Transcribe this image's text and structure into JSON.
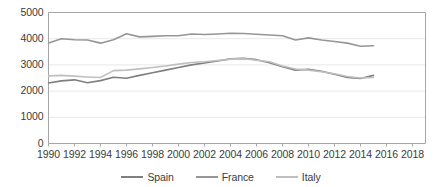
{
  "chart_data": {
    "type": "line",
    "title": "",
    "xlabel": "",
    "ylabel": "",
    "xlim": [
      1990,
      2019
    ],
    "ylim": [
      0,
      5000
    ],
    "ytick_values": [
      0,
      1000,
      2000,
      3000,
      4000,
      5000
    ],
    "ytick_labels": [
      "0",
      "1000",
      "2000",
      "3000",
      "4000",
      "5000"
    ],
    "xtick_values": [
      1990,
      1992,
      1994,
      1996,
      1998,
      2000,
      2002,
      2004,
      2006,
      2008,
      2010,
      2012,
      2014,
      2016,
      2018
    ],
    "xtick_labels": [
      "1990",
      "1992",
      "1994",
      "1996",
      "1998",
      "2000",
      "2002",
      "2004",
      "2006",
      "2008",
      "2010",
      "2012",
      "2014",
      "2016",
      "2018"
    ],
    "grid": "horizontal",
    "legend_position": "bottom",
    "x": [
      1990,
      1991,
      1992,
      1993,
      1994,
      1995,
      1996,
      1997,
      1998,
      1999,
      2000,
      2001,
      2002,
      2003,
      2004,
      2005,
      2006,
      2007,
      2008,
      2009,
      2010,
      2011,
      2012,
      2013,
      2014,
      2015
    ],
    "series": [
      {
        "name": "Spain",
        "color": "#7f7f7f",
        "values": [
          2310,
          2390,
          2430,
          2320,
          2400,
          2530,
          2490,
          2600,
          2700,
          2800,
          2900,
          3000,
          3070,
          3150,
          3230,
          3250,
          3200,
          3080,
          2930,
          2800,
          2830,
          2760,
          2640,
          2520,
          2480,
          2600
        ]
      },
      {
        "name": "France",
        "color": "#969696",
        "values": [
          3840,
          4000,
          3960,
          3950,
          3830,
          3960,
          4190,
          4070,
          4090,
          4110,
          4110,
          4180,
          4160,
          4180,
          4210,
          4200,
          4170,
          4140,
          4110,
          3950,
          4030,
          3950,
          3890,
          3830,
          3710,
          3730
        ]
      },
      {
        "name": "Italy",
        "color": "#bfbfbf",
        "values": [
          2580,
          2600,
          2570,
          2540,
          2520,
          2780,
          2800,
          2850,
          2900,
          2960,
          3030,
          3090,
          3120,
          3170,
          3220,
          3240,
          3180,
          3120,
          2960,
          2840,
          2800,
          2740,
          2660,
          2560,
          2500,
          2520
        ]
      }
    ]
  },
  "legend": {
    "entries": [
      {
        "label": "Spain"
      },
      {
        "label": "France"
      },
      {
        "label": "Italy"
      }
    ]
  },
  "axes": {
    "plot_border_color": "#a6a6a6",
    "gridline_color": "#e8e8e8",
    "tick_text_color": "#3b3b3b"
  }
}
